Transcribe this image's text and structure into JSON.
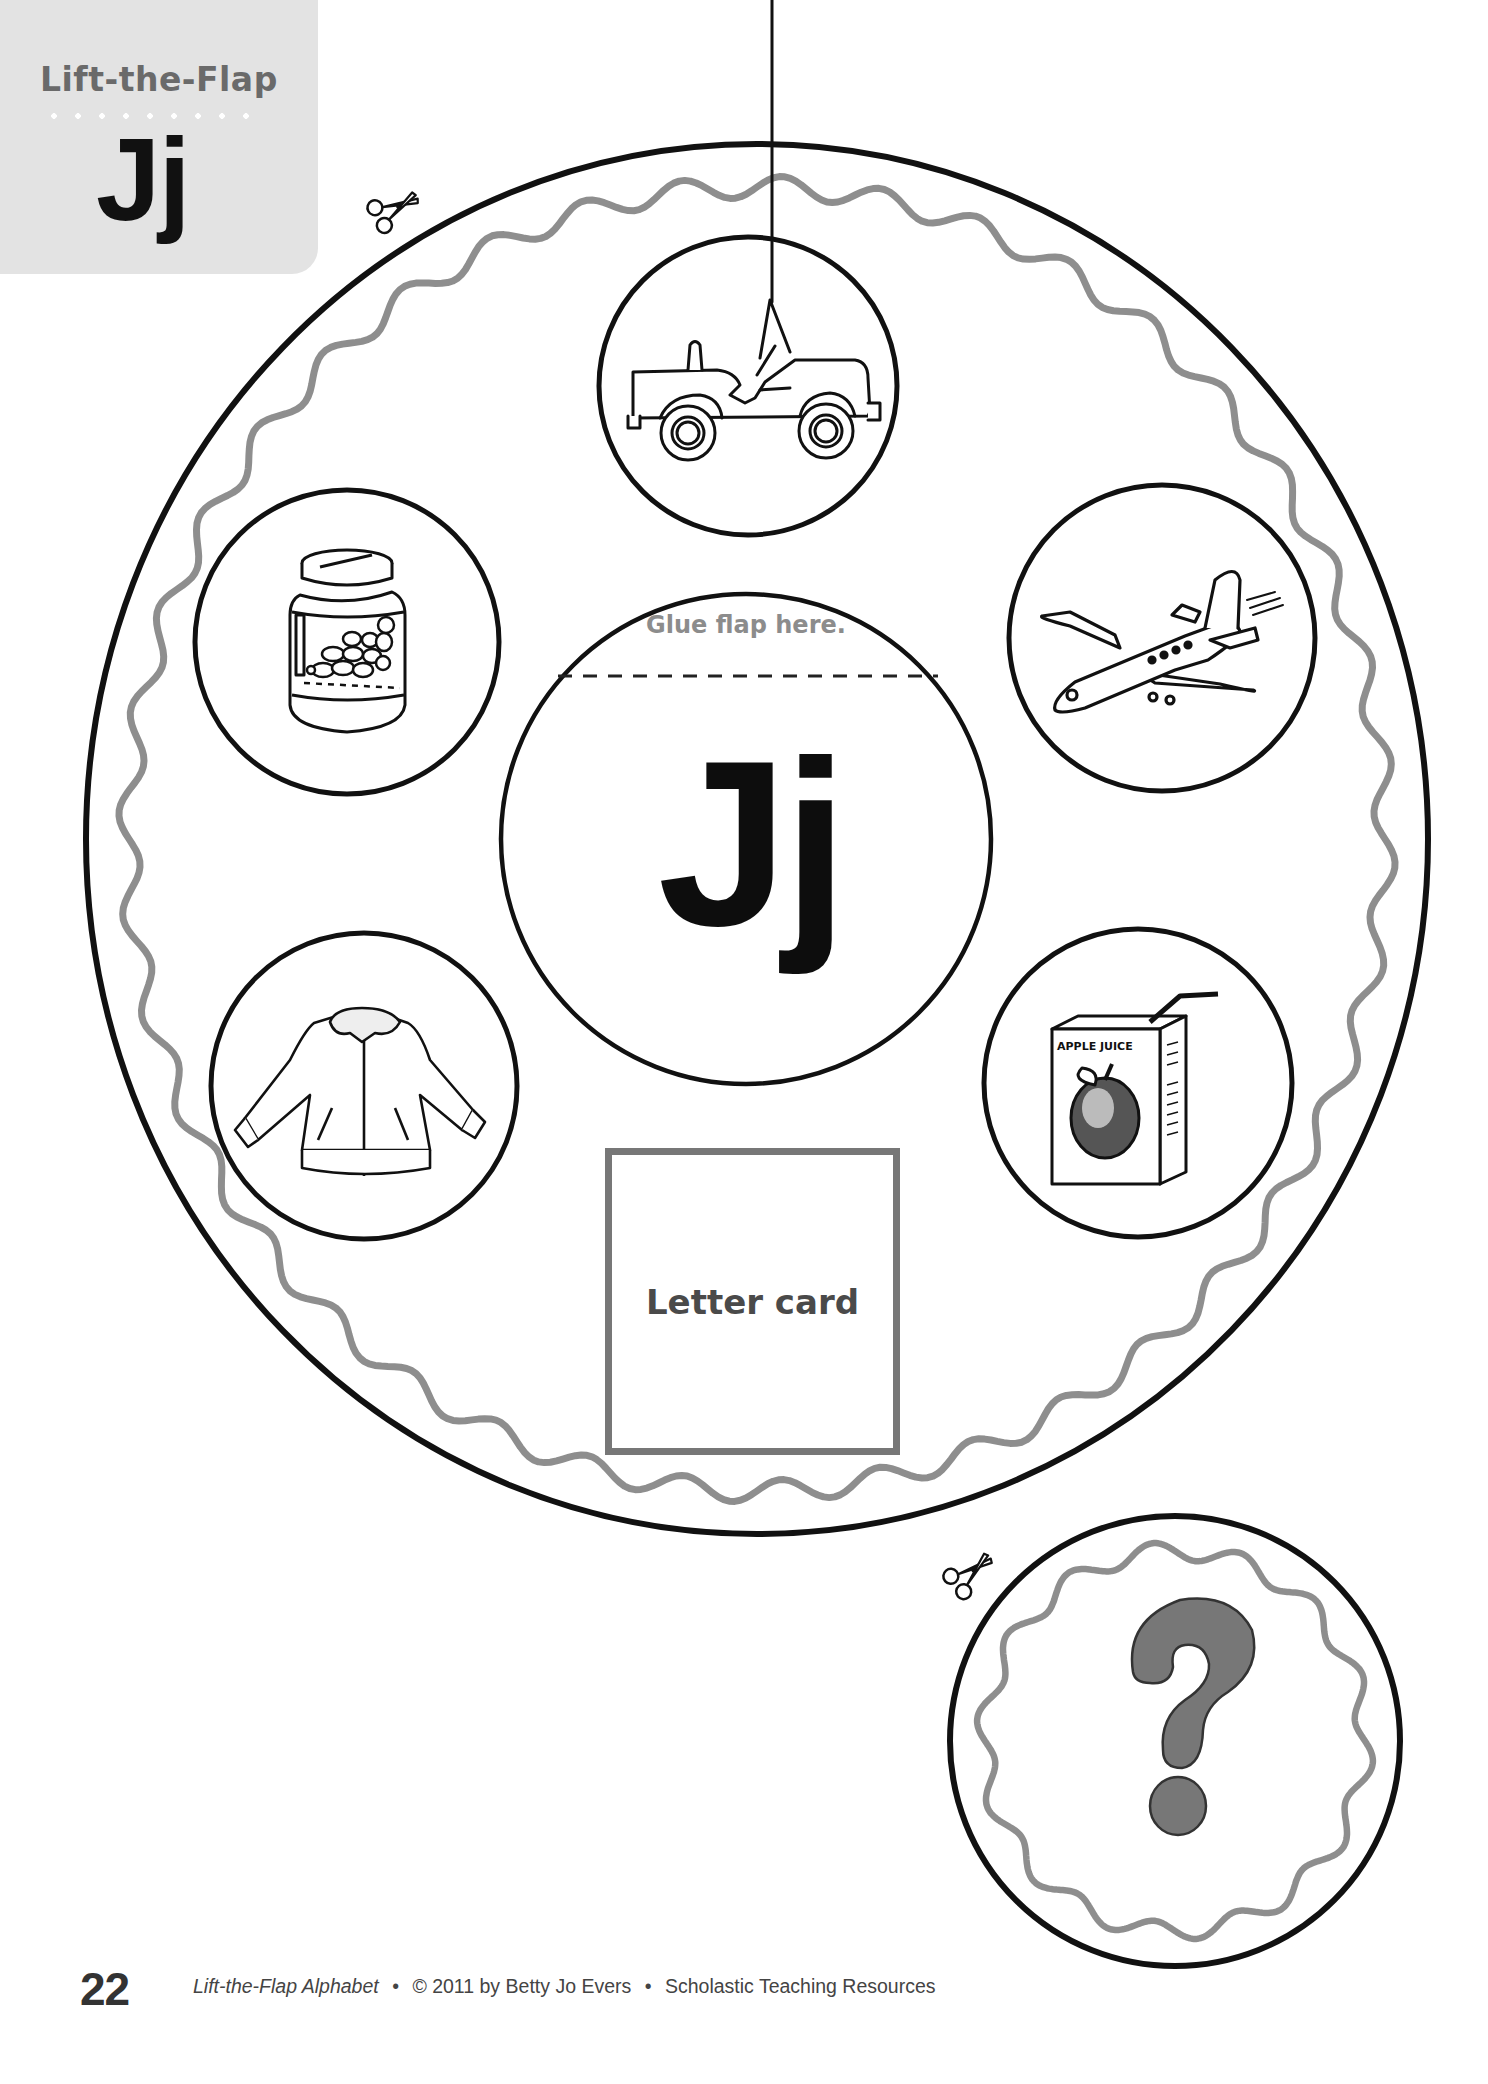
{
  "header": {
    "title": "Lift-the-Flap",
    "letter": "Jj"
  },
  "wheel": {
    "glue_label": "Glue flap here.",
    "center_letter": "Jj",
    "letter_card_label": "Letter card",
    "pictures": [
      {
        "name": "jeep",
        "icon": "jeep-icon"
      },
      {
        "name": "airplane",
        "icon": "jet-airplane-icon"
      },
      {
        "name": "apple juice",
        "icon": "juice-box-icon",
        "label": "APPLE JUICE"
      },
      {
        "name": "jacket",
        "icon": "jacket-icon"
      },
      {
        "name": "jam jar",
        "icon": "jam-jar-icon"
      }
    ]
  },
  "flap": {
    "symbol": "?"
  },
  "cut_icons": [
    "scissors-icon",
    "scissors-icon"
  ],
  "footer": {
    "page_number": "22",
    "book_title": "Lift-the-Flap Alphabet",
    "separator": "•",
    "copyright": "© 2011 by Betty Jo Evers",
    "publisher": "Scholastic Teaching Resources"
  },
  "colors": {
    "tab_gray": "#e3e3e3",
    "outline_black": "#111111",
    "wavy_gray": "#8e8e8e",
    "question_gray": "#777777",
    "label_gray": "#8c8c8c"
  }
}
